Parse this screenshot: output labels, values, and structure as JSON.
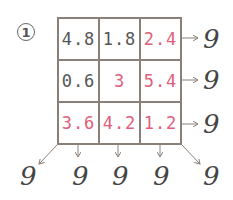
{
  "problem": {
    "number_label": "1",
    "grid": {
      "rows": [
        [
          {
            "value": "4.8",
            "color": "black"
          },
          {
            "value": "1.8",
            "color": "black"
          },
          {
            "value": "2.4",
            "color": "red"
          }
        ],
        [
          {
            "value": "0.6",
            "color": "black"
          },
          {
            "value": "3",
            "color": "red"
          },
          {
            "value": "5.4",
            "color": "red"
          }
        ],
        [
          {
            "value": "3.6",
            "color": "red"
          },
          {
            "value": "4.2",
            "color": "red"
          },
          {
            "value": "1.2",
            "color": "red"
          }
        ]
      ]
    },
    "row_sums": [
      "9",
      "9",
      "9"
    ],
    "bottom_sums": {
      "diagonal_left": "9",
      "columns": [
        "9",
        "9",
        "9"
      ],
      "diagonal_right": "9"
    }
  },
  "colors": {
    "given_text": "#555555",
    "answer_text": "#e0607a",
    "grid_line": "#8a8078",
    "arrow": "#8a8078",
    "sum_text": "#444444"
  }
}
